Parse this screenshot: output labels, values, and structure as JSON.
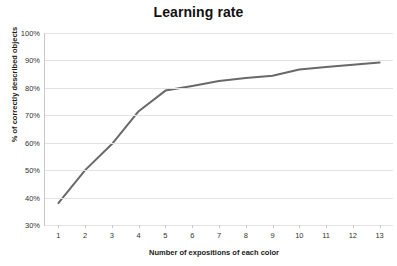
{
  "chart_data": {
    "type": "line",
    "title": "Learning rate",
    "xlabel": "Number of expositions of each color",
    "ylabel": "% of correctly described objects",
    "x": [
      1,
      2,
      3,
      4,
      5,
      6,
      7,
      8,
      9,
      10,
      11,
      12,
      13
    ],
    "xtick_labels": [
      "1",
      "2",
      "3",
      "4",
      "5",
      "6",
      "7",
      "8",
      "9",
      "10",
      "11",
      "12",
      "13"
    ],
    "ytick_labels": [
      "30%",
      "40%",
      "50%",
      "60%",
      "70%",
      "80%",
      "90%",
      "100%"
    ],
    "ytick_values": [
      30,
      40,
      50,
      60,
      70,
      80,
      90,
      100
    ],
    "values": [
      38,
      50,
      59.5,
      71.5,
      79,
      80.7,
      82.5,
      83.6,
      84.4,
      86.7,
      87.6,
      88.4,
      89.2
    ],
    "series": [
      {
        "name": "% of correctly described objects",
        "values": [
          38,
          50,
          59.5,
          71.5,
          79,
          80.7,
          82.5,
          83.6,
          84.4,
          86.7,
          87.6,
          88.4,
          89.2
        ]
      }
    ],
    "xlim": [
      0.5,
      13.5
    ],
    "ylim": [
      30,
      100
    ],
    "grid": true,
    "grid_axis": "y",
    "legend": false,
    "line_color": "#696969",
    "line_width": 2,
    "markers": false,
    "plot_background": "#ffffff",
    "grid_color": "#e2e2e2",
    "axis_color": "#c8c8c8",
    "title_color": "#111111"
  }
}
